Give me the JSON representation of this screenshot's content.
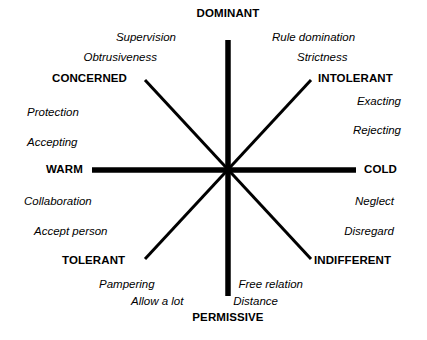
{
  "diagram": {
    "axis_color": "#000000",
    "background_color": "#ffffff",
    "center": {
      "x": 228,
      "y": 170
    },
    "poles": [
      {
        "id": "dominant",
        "label": "DOMINANT",
        "x": 228,
        "y": 14,
        "anchor": "center"
      },
      {
        "id": "permissive",
        "label": "PERMISSIVE",
        "x": 228,
        "y": 318,
        "anchor": "center"
      },
      {
        "id": "warm",
        "label": "WARM",
        "x": 46,
        "y": 170,
        "anchor": "left"
      },
      {
        "id": "cold",
        "label": "COLD",
        "x": 364,
        "y": 170,
        "anchor": "left"
      }
    ],
    "quadrants": [
      {
        "id": "concerned",
        "label": "CONCERNED",
        "x": 52,
        "y": 79,
        "anchor": "left"
      },
      {
        "id": "intolerant",
        "label": "INTOLERANT",
        "x": 318,
        "y": 79,
        "anchor": "left"
      },
      {
        "id": "tolerant",
        "label": "TOLERANT",
        "x": 62,
        "y": 261,
        "anchor": "left"
      },
      {
        "id": "indifferent",
        "label": "INDIFFERENT",
        "x": 314,
        "y": 261,
        "anchor": "left"
      }
    ],
    "traits": [
      {
        "id": "supervision",
        "label": "Supervision",
        "x": 176,
        "y": 38,
        "anchor": "right"
      },
      {
        "id": "obtrusiveness",
        "label": "Obtrusiveness",
        "x": 157,
        "y": 58,
        "anchor": "right"
      },
      {
        "id": "protection",
        "label": "Protection",
        "x": 27,
        "y": 113,
        "anchor": "left"
      },
      {
        "id": "accepting",
        "label": "Accepting",
        "x": 27,
        "y": 143,
        "anchor": "left"
      },
      {
        "id": "rule-domination",
        "label": "Rule domination",
        "x": 272,
        "y": 38,
        "anchor": "left"
      },
      {
        "id": "strictness",
        "label": "Strictness",
        "x": 297,
        "y": 58,
        "anchor": "left"
      },
      {
        "id": "exacting",
        "label": "Exacting",
        "x": 401,
        "y": 102,
        "anchor": "right"
      },
      {
        "id": "rejecting",
        "label": "Rejecting",
        "x": 401,
        "y": 131,
        "anchor": "right"
      },
      {
        "id": "collaboration",
        "label": "Collaboration",
        "x": 24,
        "y": 202,
        "anchor": "left"
      },
      {
        "id": "accept-person",
        "label": "Accept person",
        "x": 34,
        "y": 232,
        "anchor": "left"
      },
      {
        "id": "pampering",
        "label": "Pampering",
        "x": 99,
        "y": 285,
        "anchor": "left"
      },
      {
        "id": "allow-a-lot",
        "label": "Allow a lot",
        "x": 131,
        "y": 302,
        "anchor": "left"
      },
      {
        "id": "neglect",
        "label": "Neglect",
        "x": 394,
        "y": 202,
        "anchor": "right"
      },
      {
        "id": "disregard",
        "label": "Disregard",
        "x": 394,
        "y": 232,
        "anchor": "right"
      },
      {
        "id": "free-relation",
        "label": "Free relation",
        "x": 303,
        "y": 285,
        "anchor": "right"
      },
      {
        "id": "distance",
        "label": "Distance",
        "x": 278,
        "y": 302,
        "anchor": "right"
      }
    ]
  }
}
